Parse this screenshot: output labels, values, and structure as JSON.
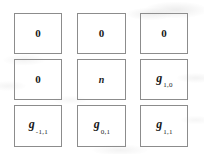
{
  "diagram": {
    "kind": "3x3-neighborhood-grid",
    "rows": 3,
    "columns": 3,
    "border_color": "#8c8c8c",
    "background_color": "#ffffff",
    "text_color": "#1a1a1a",
    "cells": [
      {
        "id": "cell-r0-c0",
        "row": 0,
        "column": 0,
        "style": "plain",
        "base": "0",
        "subscript": "",
        "x": 14,
        "y": 13,
        "width": 48,
        "height": 41
      },
      {
        "id": "cell-r0-c1",
        "row": 0,
        "column": 1,
        "style": "plain",
        "base": "0",
        "subscript": "",
        "x": 77,
        "y": 13,
        "width": 49,
        "height": 41
      },
      {
        "id": "cell-r0-c2",
        "row": 0,
        "column": 2,
        "style": "plain",
        "base": "0",
        "subscript": "",
        "x": 140,
        "y": 13,
        "width": 48,
        "height": 41
      },
      {
        "id": "cell-r1-c0",
        "row": 1,
        "column": 0,
        "style": "plain",
        "base": "0",
        "subscript": "",
        "x": 14,
        "y": 59,
        "width": 48,
        "height": 41
      },
      {
        "id": "cell-r1-c1",
        "row": 1,
        "column": 1,
        "style": "symbol-center",
        "base": "n",
        "subscript": "",
        "x": 77,
        "y": 59,
        "width": 49,
        "height": 41
      },
      {
        "id": "cell-r1-c2",
        "row": 1,
        "column": 2,
        "style": "symbol",
        "base": "g",
        "subscript": "1,0",
        "x": 140,
        "y": 59,
        "width": 48,
        "height": 41
      },
      {
        "id": "cell-r2-c0",
        "row": 2,
        "column": 0,
        "style": "symbol",
        "base": "g",
        "subscript": "-1,1",
        "x": 14,
        "y": 105,
        "width": 48,
        "height": 42
      },
      {
        "id": "cell-r2-c1",
        "row": 2,
        "column": 1,
        "style": "symbol",
        "base": "g",
        "subscript": "0,1",
        "x": 77,
        "y": 105,
        "width": 49,
        "height": 42
      },
      {
        "id": "cell-r2-c2",
        "row": 2,
        "column": 2,
        "style": "symbol",
        "base": "g",
        "subscript": "1,1",
        "x": 140,
        "y": 105,
        "width": 48,
        "height": 42
      }
    ]
  }
}
